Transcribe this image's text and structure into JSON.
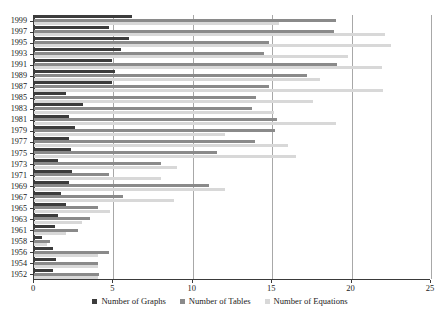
{
  "chart_data": {
    "type": "bar",
    "orientation": "horizontal",
    "title": "",
    "subtitle": "",
    "xlabel": "",
    "ylabel": "",
    "xlim": [
      0,
      25
    ],
    "ylim": null,
    "grid": true,
    "grid_axis": "x",
    "legend_position": "bottom",
    "xticks": [
      0,
      5,
      10,
      15,
      20,
      25
    ],
    "xtick_labels": [
      "0",
      "5",
      "10",
      "15",
      "20",
      "25"
    ],
    "categories": [
      "1999",
      "1997",
      "1995",
      "1993",
      "1991",
      "1989",
      "1987",
      "1985",
      "1983",
      "1981",
      "1979",
      "1977",
      "1975",
      "1973",
      "1971",
      "1969",
      "1967",
      "1965",
      "1963",
      "1961",
      "1958",
      "1956",
      "1954",
      "1952"
    ],
    "series": [
      {
        "name": "Number of Graphs",
        "color": "#3c3c3c",
        "values": [
          6.2,
          4.7,
          6.0,
          5.5,
          4.9,
          5.1,
          4.9,
          2.0,
          3.1,
          2.2,
          2.6,
          2.2,
          2.3,
          1.5,
          2.4,
          2.2,
          1.7,
          2.0,
          1.5,
          1.3,
          0.5,
          1.2,
          1.4,
          1.2
        ]
      },
      {
        "name": "Number of Tables",
        "color": "#8a8a8a",
        "values": [
          19.0,
          18.9,
          14.8,
          14.5,
          19.1,
          17.2,
          14.8,
          14.0,
          13.7,
          15.3,
          15.2,
          13.9,
          11.5,
          8.0,
          4.7,
          11.0,
          5.6,
          4.0,
          3.5,
          2.8,
          1.0,
          4.7,
          4.0,
          4.1
        ]
      },
      {
        "name": "Number of Equations",
        "color": "#d8d8d8",
        "values": [
          15.4,
          22.1,
          22.5,
          19.8,
          21.9,
          18.0,
          22.0,
          17.6,
          15.1,
          19.0,
          12.0,
          16.0,
          16.5,
          9.0,
          8.0,
          12.0,
          8.8,
          4.8,
          3.0,
          2.0,
          0.8,
          4.0,
          4.0,
          4.0
        ]
      }
    ],
    "legend": [
      {
        "label": "Number of Graphs",
        "color": "#3c3c3c",
        "icon": "square-marker-dark"
      },
      {
        "label": "Number of Tables",
        "color": "#8a8a8a",
        "icon": "square-marker-mid"
      },
      {
        "label": "Number of Equations",
        "color": "#d8d8d8",
        "icon": "square-marker-light"
      }
    ]
  }
}
